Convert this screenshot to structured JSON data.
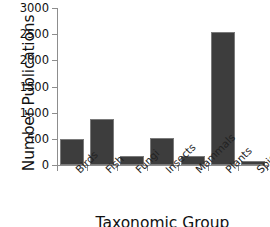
{
  "chart_data": {
    "type": "bar",
    "title": "",
    "categories": [
      "Birds",
      "Fish",
      "Fungi",
      "Insects",
      "Mammals",
      "Plants",
      "Spiders"
    ],
    "values": [
      490,
      880,
      175,
      525,
      175,
      2540,
      70
    ],
    "xlabel": "Taxonomic Group",
    "ylabel": "Number Publications",
    "ylim": [
      0,
      3000
    ],
    "yticks": [
      0,
      500,
      1000,
      1500,
      2000,
      2500,
      3000
    ],
    "ytick_labels": [
      "0",
      "500",
      "1000",
      "1500",
      "2000",
      "2500",
      "3000"
    ],
    "grid": false,
    "legend": null,
    "bar_color": "#3d3d3d",
    "bar_edge_color": "#7a7a7a",
    "axis_color": "#8d8d8d",
    "label_rotation": -45
  }
}
